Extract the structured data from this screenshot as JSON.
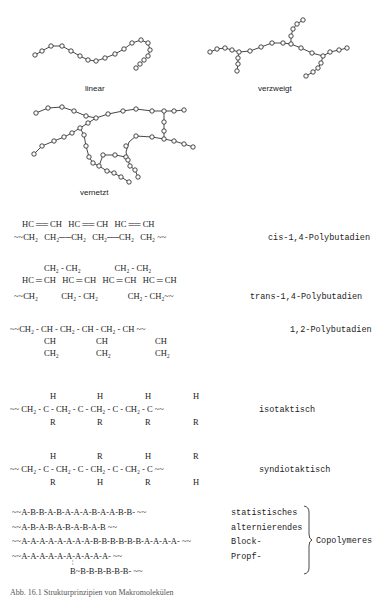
{
  "structures": {
    "linear": {
      "label": "linear"
    },
    "branched": {
      "label": "verzweigt"
    },
    "crosslinked": {
      "label": "vernetzt"
    }
  },
  "polybutadiene": {
    "cis": {
      "top": "HC ══ CH   HC ══ CH   HC ══ CH",
      "bottom": "~~CH₂   CH₂──CH₂   CH₂──CH₂   CH₂ ~~",
      "name": "cis-1,4-Polybutadien"
    },
    "trans": {
      "row1": "CH₂ - CH₂                CH₂ - CH₂",
      "row2": "HC ═ CH   HC ═ CH   HC ═ CH   HC ═ CH",
      "row3": "~~CH₂           CH₂ - CH₂              CH₂ - CH₂~~",
      "name": "trans-1,4-Polybutadien"
    },
    "vinyl": {
      "main": "~~CH₂ - CH - CH₂ - CH - CH₂ - CH ~~",
      "side1": "CH",
      "side2": "CH₂",
      "name": "1,2-Polybutadien"
    }
  },
  "tacticity": {
    "isotactic": {
      "top": [
        "H",
        "H",
        "H",
        "H"
      ],
      "main": "~~ CH₂ - C - CH₂ - C - CH₂ - C - CH₂ - C ~~",
      "bottom": [
        "R",
        "R",
        "R",
        "R"
      ],
      "name": "isotaktisch"
    },
    "syndiotactic": {
      "top": [
        "H",
        "R",
        "H",
        "R"
      ],
      "main": "~~ CH₂ - C - CH₂ - C - CH₂ - C - CH₂ - C ~~",
      "bottom": [
        "R",
        "H",
        "R",
        "H"
      ],
      "name": "syndiotaktisch"
    }
  },
  "copolymers": {
    "rows": [
      {
        "chain": "~~A-B-B-A-B-A-A-A-B-A-A-B-B- ~~",
        "type": "statistisches"
      },
      {
        "chain": "~~A-B-A-B-A-B-A-B-A-B ~~",
        "type": "alternierendes"
      },
      {
        "chain": "~~A-A-A-A-A-A-A-A-B-B-B-B-B-B-A-A-A-A- ~~",
        "type": "Block-"
      },
      {
        "chain": "~~A-A-A-A-A-A-A-A-A-A- ~~",
        "type": "Propf-"
      }
    ],
    "graft_branch": "B~B-B-B-B-B-B- ~~",
    "group_label": "Copolymeres"
  },
  "caption": "Abb. 16.1 Strukturprinzipien von Makromolekülen"
}
